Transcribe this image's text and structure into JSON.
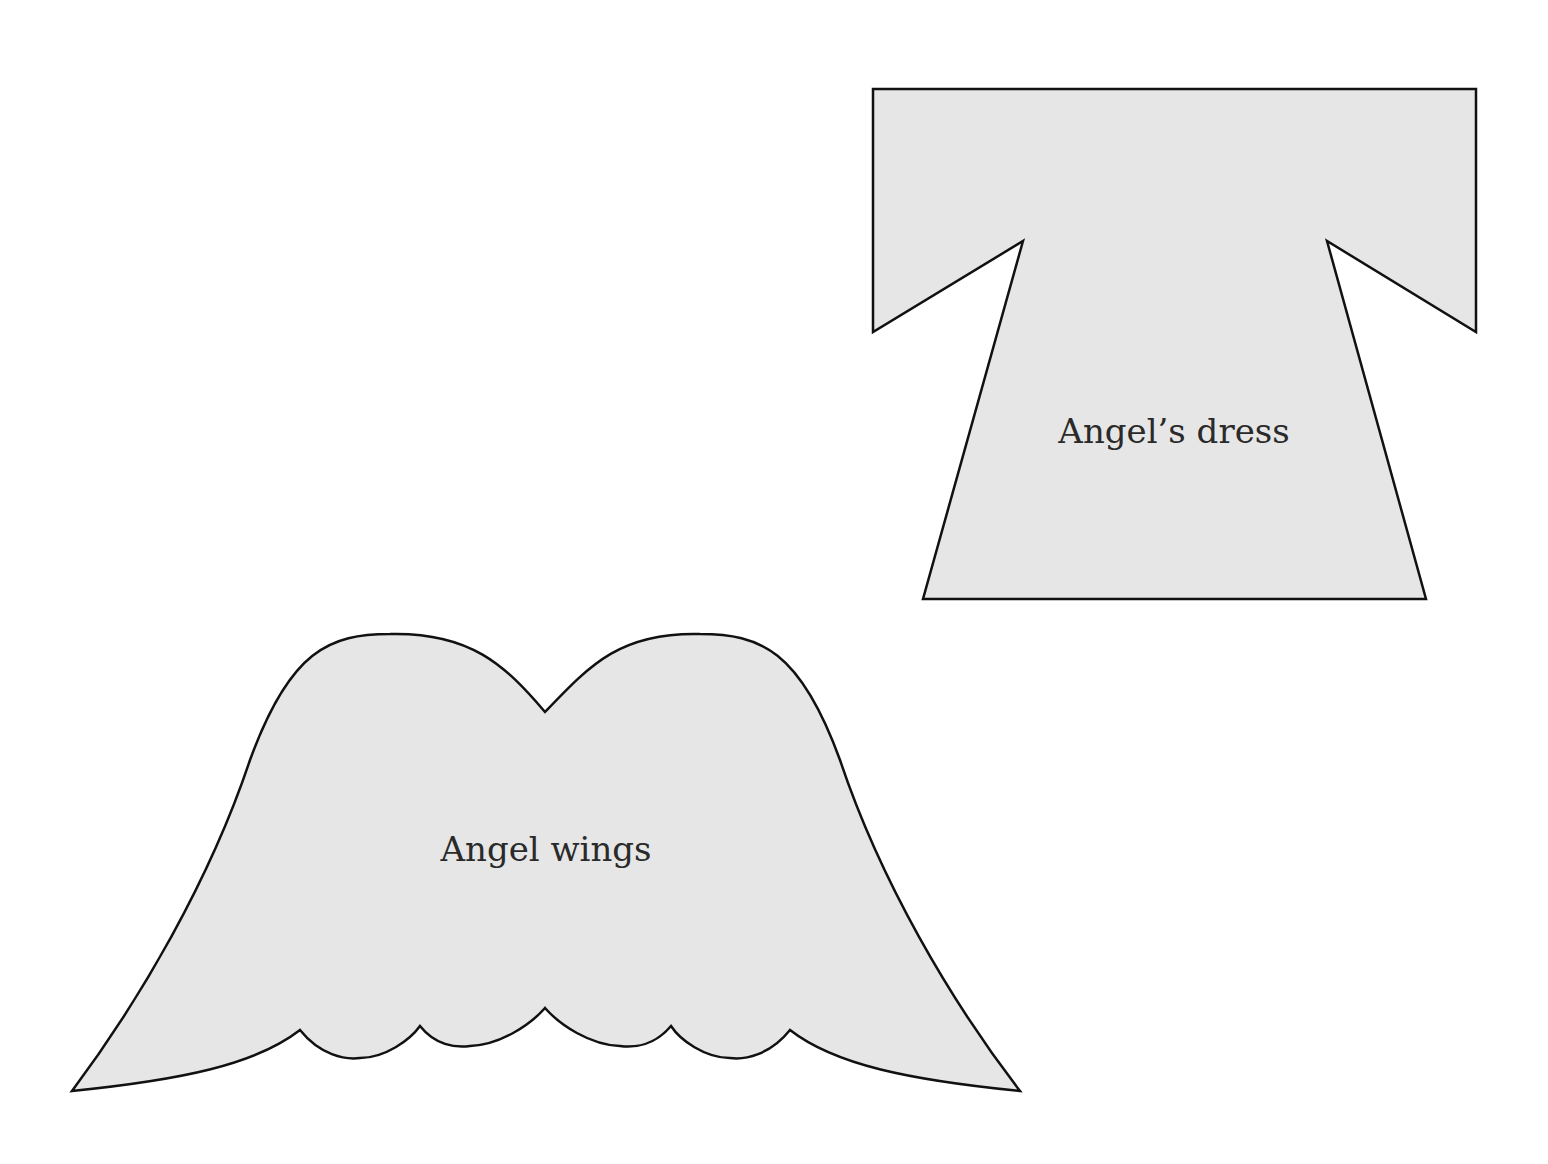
{
  "page": {
    "background": "#ffffff",
    "shape_fill": "#e6e6e6",
    "shape_stroke": "#111111"
  },
  "templates": [
    {
      "id": "dress",
      "label": "Angel’s dress",
      "points": [
        [
          873,
          89
        ],
        [
          1476,
          89
        ],
        [
          1476,
          332
        ],
        [
          1327,
          241
        ],
        [
          1426,
          599
        ],
        [
          923,
          599
        ],
        [
          1023,
          241
        ],
        [
          873,
          332
        ]
      ],
      "label_pos": [
        1174,
        443
      ]
    },
    {
      "id": "wings",
      "label": "Angel wings",
      "label_pos": [
        546,
        861
      ]
    }
  ]
}
